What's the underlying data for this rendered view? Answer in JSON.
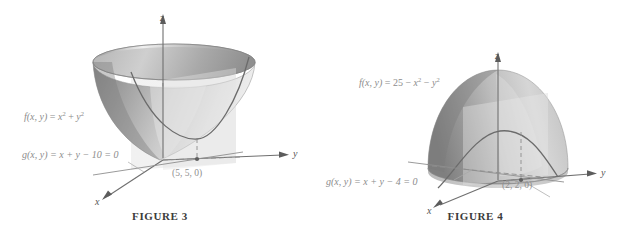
{
  "page": {
    "width": 631,
    "height": 240,
    "background": "#ffffff",
    "type": "textbook-figure-pair",
    "topic": "Lagrange multipliers / constrained optimization"
  },
  "colors": {
    "surface_mid": "#9a9a9a",
    "surface_light": "#d9d9d9",
    "surface_dark": "#7e7e7e",
    "curve": "#6a6a6a",
    "axis": "#6f6f6f",
    "label_gray": "#8c8c8c",
    "caption": "#3b3b3b",
    "plane_fill": "#cfcfcf"
  },
  "figure3": {
    "caption": "FIGURE 3",
    "surface_label_parts": {
      "fn": "f",
      "args": "(x, y)",
      "equals": " = ",
      "base1": "x",
      "exp1": "2",
      "plus": " + ",
      "base2": "y",
      "exp2": "2"
    },
    "surface_label_text": "f(x, y) = x2 + y2",
    "constraint_label": "g(x, y) = x + y − 10 = 0",
    "point_label": "(5, 5, 0)",
    "axes": {
      "x": "x",
      "y": "y",
      "z": "z"
    },
    "surface_type": "elliptic paraboloid bowl opening upward",
    "constraint_type": "vertical plane over line x + y = 10",
    "trace_curve": "parabola-like trace of f on the constraint plane"
  },
  "figure4": {
    "caption": "FIGURE 4",
    "surface_label_parts": {
      "fn": "f",
      "args": "(x, y)",
      "equals": " = ",
      "const": "25",
      "minus1": " − ",
      "base1": "x",
      "exp1": "2",
      "minus2": " − ",
      "base2": "y",
      "exp2": "2"
    },
    "surface_label_text": "f(x, y) = 25 − x2 − y2",
    "constraint_label": "g(x, y) = x + y − 4 = 0",
    "point_label": "(2, 2, 0)",
    "axes": {
      "x": "x",
      "y": "y",
      "z": "z"
    },
    "surface_type": "downward opening paraboloid dome",
    "constraint_type": "vertical plane over line x + y = 4",
    "trace_curve": "downward parabola trace of f on the constraint plane"
  }
}
